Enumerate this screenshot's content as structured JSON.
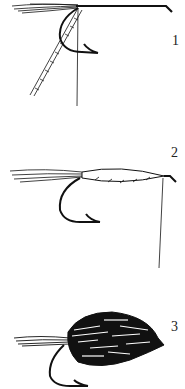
{
  "diagram": {
    "steps": [
      {
        "number": "1",
        "description": "tail and ribbing tied in at hook bend, thread at shank"
      },
      {
        "number": "2",
        "description": "body wrapped with ribbing, thread hanging at eye"
      },
      {
        "number": "3",
        "description": "completed fly with mottled wing/body"
      }
    ],
    "colors": {
      "ink": "#111111",
      "background": "#ffffff"
    }
  }
}
